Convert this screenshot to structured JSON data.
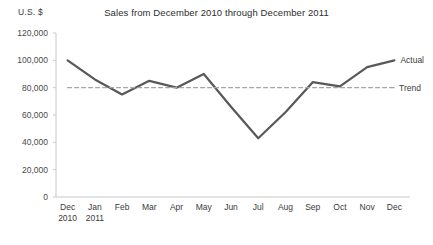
{
  "chart_data": {
    "type": "line",
    "title": "Sales from December 2010 through December 2011",
    "ylabel": "U.S. $",
    "xlabel": "",
    "ylim": [
      0,
      120000
    ],
    "ytick_labels": [
      "120,000",
      "100,000",
      "80,000",
      "60,000",
      "40,000",
      "20,000",
      "0"
    ],
    "ytick_values": [
      120000,
      100000,
      80000,
      60000,
      40000,
      20000,
      0
    ],
    "grid": false,
    "legend_position": "inline-right",
    "categories": [
      "Dec\n2010",
      "Jan\n2011",
      "Feb",
      "Mar",
      "Apr",
      "May",
      "Jun",
      "Jul",
      "Aug",
      "Sep",
      "Oct",
      "Nov",
      "Dec"
    ],
    "category_lines": [
      [
        "Dec",
        "2010"
      ],
      [
        "Jan",
        "2011"
      ],
      [
        "Feb",
        ""
      ],
      [
        "Mar",
        ""
      ],
      [
        "Apr",
        ""
      ],
      [
        "May",
        ""
      ],
      [
        "Jun",
        ""
      ],
      [
        "Jul",
        ""
      ],
      [
        "Aug",
        ""
      ],
      [
        "Sep",
        ""
      ],
      [
        "Oct",
        ""
      ],
      [
        "Nov",
        ""
      ],
      [
        "Dec",
        ""
      ]
    ],
    "series": [
      {
        "name": "Actual",
        "style": "solid",
        "color": "#585858",
        "values": [
          100000,
          86000,
          75000,
          85000,
          80000,
          90000,
          66000,
          43000,
          62000,
          84000,
          81000,
          95000,
          100000
        ]
      },
      {
        "name": "Trend",
        "style": "dashed",
        "color": "#a6a6a6",
        "constant": 80000,
        "values": [
          80000,
          80000,
          80000,
          80000,
          80000,
          80000,
          80000,
          80000,
          80000,
          80000,
          80000,
          80000,
          80000
        ]
      }
    ],
    "axis_color": "#c8c8c8"
  }
}
